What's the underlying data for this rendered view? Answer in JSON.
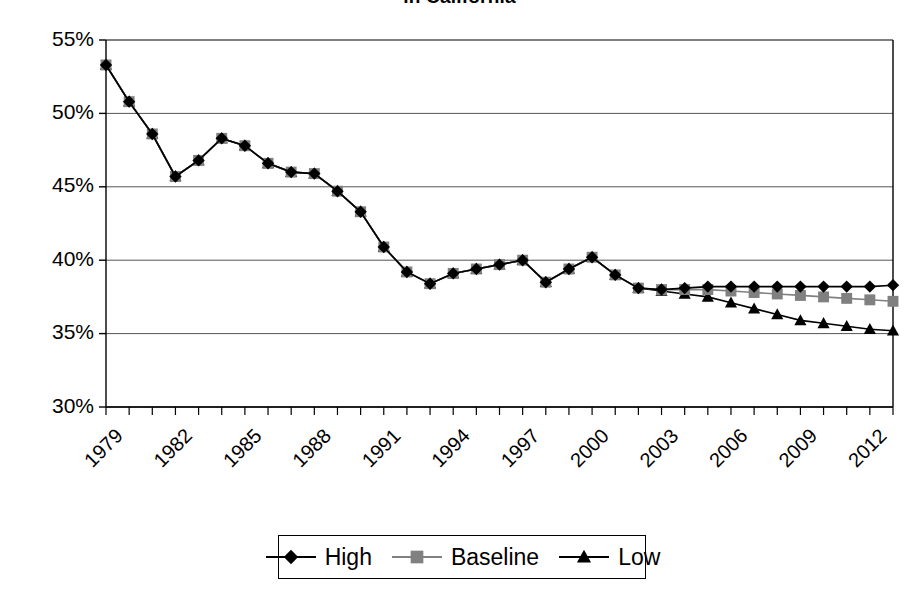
{
  "chart_data": {
    "type": "line",
    "title": "in California",
    "xlabel": "",
    "ylabel": "",
    "xlim": [
      1979,
      2013
    ],
    "ylim": [
      30,
      55
    ],
    "ytick_labels": [
      "55%",
      "50%",
      "45%",
      "40%",
      "35%",
      "30%"
    ],
    "ytick_values": [
      55,
      50,
      45,
      40,
      35,
      30
    ],
    "xtick_labels": [
      "1979",
      "1982",
      "1985",
      "1988",
      "1991",
      "1994",
      "1997",
      "2000",
      "2003",
      "2006",
      "2009",
      "2012"
    ],
    "xtick_values": [
      1979,
      1982,
      1985,
      1988,
      1991,
      1994,
      1997,
      2000,
      2003,
      2006,
      2009,
      2012
    ],
    "grid": true,
    "legend_position": "bottom",
    "x": [
      1979,
      1980,
      1981,
      1982,
      1983,
      1984,
      1985,
      1986,
      1987,
      1988,
      1989,
      1990,
      1991,
      1992,
      1993,
      1994,
      1995,
      1996,
      1997,
      1998,
      1999,
      2000,
      2001,
      2002,
      2003,
      2004,
      2005,
      2006,
      2007,
      2008,
      2009,
      2010,
      2011,
      2012,
      2013
    ],
    "series": [
      {
        "name": "High",
        "marker": "diamond",
        "color": "#000000",
        "values": [
          53.3,
          50.8,
          48.6,
          45.7,
          46.8,
          48.3,
          47.8,
          46.6,
          46.0,
          45.9,
          44.7,
          43.3,
          40.9,
          39.2,
          38.4,
          39.1,
          39.4,
          39.7,
          40.0,
          38.5,
          39.4,
          40.2,
          39.0,
          38.1,
          38.0,
          38.1,
          38.2,
          38.2,
          38.2,
          38.2,
          38.2,
          38.2,
          38.2,
          38.2,
          38.3
        ]
      },
      {
        "name": "Baseline",
        "marker": "square",
        "color": "#808080",
        "values": [
          53.3,
          50.8,
          48.6,
          45.7,
          46.8,
          48.3,
          47.8,
          46.6,
          46.0,
          45.9,
          44.7,
          43.3,
          40.9,
          39.2,
          38.4,
          39.1,
          39.4,
          39.7,
          40.0,
          38.5,
          39.4,
          40.2,
          39.0,
          38.1,
          38.0,
          38.0,
          38.0,
          37.9,
          37.8,
          37.7,
          37.6,
          37.5,
          37.4,
          37.3,
          37.2
        ]
      },
      {
        "name": "Low",
        "marker": "triangle",
        "color": "#000000",
        "values": [
          53.3,
          50.8,
          48.6,
          45.7,
          46.8,
          48.3,
          47.8,
          46.6,
          46.0,
          45.9,
          44.7,
          43.3,
          40.9,
          39.2,
          38.4,
          39.1,
          39.4,
          39.7,
          40.0,
          38.5,
          39.4,
          40.2,
          39.0,
          38.1,
          37.9,
          37.7,
          37.5,
          37.1,
          36.7,
          36.3,
          35.9,
          35.7,
          35.5,
          35.3,
          35.2
        ]
      }
    ]
  },
  "legend": {
    "items": [
      {
        "label": "High",
        "marker": "diamond",
        "color": "#000000"
      },
      {
        "label": "Baseline",
        "marker": "square",
        "color": "#808080"
      },
      {
        "label": "Low",
        "marker": "triangle",
        "color": "#000000"
      }
    ]
  },
  "geometry": {
    "plot_left": 106,
    "plot_right": 893,
    "plot_top": 40,
    "plot_bottom": 407,
    "legend_left": 278,
    "legend_top": 535,
    "legend_width": 368,
    "legend_height": 44
  }
}
